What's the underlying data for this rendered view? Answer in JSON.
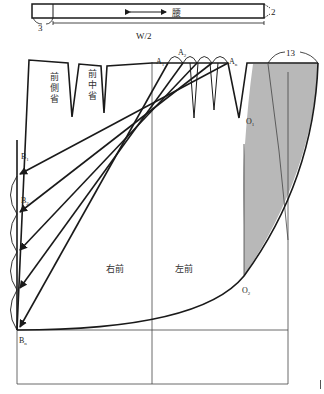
{
  "waistband": {
    "label": "腰",
    "extension_label": "3",
    "right_label": "2",
    "width_label": "W/2"
  },
  "darts": {
    "side_dart_label": "前側省",
    "middle_dart_label": "前中省"
  },
  "points": {
    "A1": {
      "base": "A",
      "sub": "1"
    },
    "A2": {
      "base": "A",
      "sub": "2"
    },
    "An": {
      "base": "A",
      "sub": "n"
    },
    "B1": {
      "base": "B",
      "sub": "1"
    },
    "B2": {
      "base": "B",
      "sub": "2"
    },
    "Bn": {
      "base": "B",
      "sub": "n"
    },
    "O1": {
      "base": "O",
      "sub": "1"
    },
    "O2": {
      "base": "O",
      "sub": "2"
    }
  },
  "measure_label": "13",
  "panels": {
    "right_front": "右前",
    "left_front": "左前"
  },
  "colors": {
    "line": "#1a1a1a",
    "thin_line": "#444444",
    "shaded": "#b8b8b8"
  }
}
